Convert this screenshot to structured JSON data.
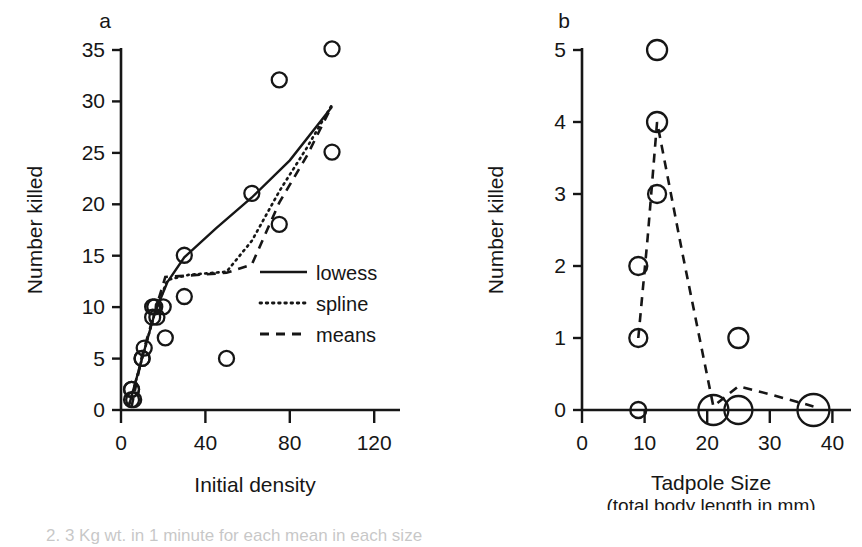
{
  "figure": {
    "background_color": "#ffffff",
    "ink_color": "#161616",
    "caption_partial": "2. 3 Kg wt. in 1 minute for each mean in each size"
  },
  "chart_data": [
    {
      "type": "scatter",
      "panel_letter": "a",
      "title": "",
      "xlabel": "Initial density",
      "ylabel": "Number killed",
      "xlim": [
        0,
        127
      ],
      "ylim": [
        0,
        37
      ],
      "xticks": [
        0,
        40,
        80,
        120
      ],
      "xtick_labels": [
        "0",
        "40",
        "80",
        "120"
      ],
      "yticks": [
        0,
        5,
        10,
        15,
        20,
        25,
        30,
        35
      ],
      "ytick_labels": [
        "0",
        "5",
        "10",
        "15",
        "20",
        "25",
        "30",
        "35"
      ],
      "grid": false,
      "legend_position": "center-right",
      "points": [
        {
          "x": 5,
          "y": 1
        },
        {
          "x": 5,
          "y": 2
        },
        {
          "x": 5,
          "y": 2
        },
        {
          "x": 6,
          "y": 1
        },
        {
          "x": 10,
          "y": 5
        },
        {
          "x": 10,
          "y": 5
        },
        {
          "x": 11,
          "y": 6
        },
        {
          "x": 15,
          "y": 9
        },
        {
          "x": 15,
          "y": 10
        },
        {
          "x": 16,
          "y": 10
        },
        {
          "x": 17,
          "y": 9
        },
        {
          "x": 20,
          "y": 10
        },
        {
          "x": 21,
          "y": 7
        },
        {
          "x": 30,
          "y": 11
        },
        {
          "x": 30,
          "y": 15
        },
        {
          "x": 50,
          "y": 5
        },
        {
          "x": 62,
          "y": 21
        },
        {
          "x": 75,
          "y": 18
        },
        {
          "x": 75,
          "y": 32
        },
        {
          "x": 100,
          "y": 25
        },
        {
          "x": 100,
          "y": 35
        }
      ],
      "series": [
        {
          "name": "lowess",
          "style": "solid",
          "points": [
            {
              "x": 4,
              "y": 0.6
            },
            {
              "x": 10,
              "y": 5.0
            },
            {
              "x": 16,
              "y": 9.4
            },
            {
              "x": 22,
              "y": 12.4
            },
            {
              "x": 30,
              "y": 14.8
            },
            {
              "x": 45,
              "y": 17.6
            },
            {
              "x": 62,
              "y": 20.6
            },
            {
              "x": 80,
              "y": 24.2
            },
            {
              "x": 100,
              "y": 29.4
            }
          ]
        },
        {
          "name": "spline",
          "style": "dotted",
          "points": [
            {
              "x": 4,
              "y": 0.6
            },
            {
              "x": 10,
              "y": 5.0
            },
            {
              "x": 16,
              "y": 9.4
            },
            {
              "x": 22,
              "y": 12.6
            },
            {
              "x": 32,
              "y": 13.1
            },
            {
              "x": 50,
              "y": 13.4
            },
            {
              "x": 62,
              "y": 16.4
            },
            {
              "x": 75,
              "y": 21.2
            },
            {
              "x": 88,
              "y": 25.4
            },
            {
              "x": 100,
              "y": 29.6
            }
          ]
        },
        {
          "name": "means",
          "style": "dashed",
          "points": [
            {
              "x": 5,
              "y": 0.3
            },
            {
              "x": 10,
              "y": 5.3
            },
            {
              "x": 16,
              "y": 9.5
            },
            {
              "x": 21,
              "y": 12.9
            },
            {
              "x": 30,
              "y": 13.0
            },
            {
              "x": 50,
              "y": 13.3
            },
            {
              "x": 62,
              "y": 14.1
            },
            {
              "x": 75,
              "y": 20.1
            },
            {
              "x": 88,
              "y": 24.6
            },
            {
              "x": 100,
              "y": 29.5
            }
          ]
        }
      ],
      "legend": [
        {
          "label": "lowess",
          "style": "solid"
        },
        {
          "label": "spline",
          "style": "dotted"
        },
        {
          "label": "means",
          "style": "dashed"
        }
      ]
    },
    {
      "type": "scatter",
      "panel_letter": "b",
      "title": "",
      "xlabel": "Tadpole Size",
      "xlabel_sub": "(total body length in mm)",
      "ylabel": "Number killed",
      "xlim": [
        0,
        43
      ],
      "ylim": [
        0,
        5.4
      ],
      "xticks": [
        0,
        10,
        20,
        30,
        40
      ],
      "xtick_labels": [
        "0",
        "10",
        "20",
        "30",
        "40"
      ],
      "yticks": [
        0,
        1,
        2,
        3,
        4,
        5
      ],
      "ytick_labels": [
        "0",
        "1",
        "2",
        "3",
        "4",
        "5"
      ],
      "grid": false,
      "legend_position": "none",
      "points": [
        {
          "x": 9,
          "y": 0,
          "size": 8
        },
        {
          "x": 9,
          "y": 1,
          "size": 9
        },
        {
          "x": 9,
          "y": 2,
          "size": 9
        },
        {
          "x": 12,
          "y": 3,
          "size": 9
        },
        {
          "x": 12,
          "y": 4,
          "size": 10
        },
        {
          "x": 12,
          "y": 5,
          "size": 10
        },
        {
          "x": 21,
          "y": 0,
          "size": 15
        },
        {
          "x": 25,
          "y": 0,
          "size": 14
        },
        {
          "x": 25,
          "y": 1,
          "size": 10
        },
        {
          "x": 37,
          "y": 0,
          "size": 16
        }
      ],
      "series": [
        {
          "name": "means",
          "style": "dashed",
          "points": [
            {
              "x": 9,
              "y": 1.0
            },
            {
              "x": 10.5,
              "y": 2.4
            },
            {
              "x": 12,
              "y": 4.0
            },
            {
              "x": 16,
              "y": 2.2
            },
            {
              "x": 21,
              "y": 0.05
            },
            {
              "x": 25,
              "y": 0.33
            },
            {
              "x": 30,
              "y": 0.22
            },
            {
              "x": 37,
              "y": 0.05
            }
          ]
        }
      ]
    }
  ]
}
